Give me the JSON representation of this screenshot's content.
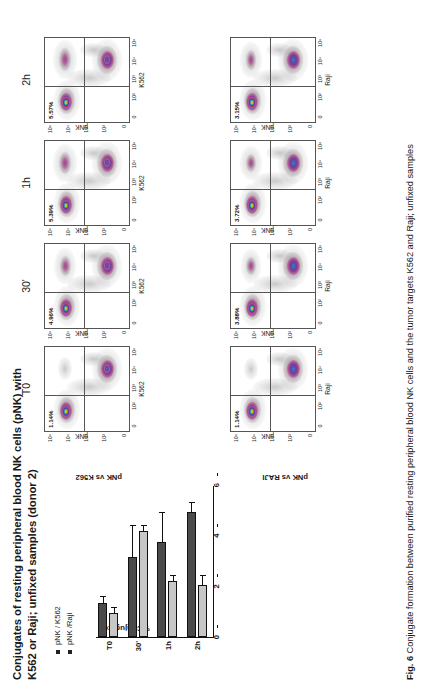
{
  "figure": {
    "title": "Conjugates of resting peripheral blood NK cells (pNK) with K562 or Raji; unfixed samples (donor 2)",
    "caption_label": "Fig. 6",
    "caption_text": "Conjugate formation between purified resting peripheral blood NK cells and the tumor targets K562 and Raji; unfixed samples"
  },
  "barchart": {
    "y_axis_title": "%Conjugates",
    "y_ticks": [
      "0",
      "2",
      "4",
      "6"
    ],
    "x_ticks": [
      "T0",
      "30'",
      "1h",
      "2h"
    ],
    "legend": [
      {
        "label": "pNK / K562",
        "color": "#4a4a4a"
      },
      {
        "label": "pNK /Raji",
        "color": "#c7c7c7"
      }
    ]
  },
  "chart_data": {
    "type": "bar",
    "title": "Conjugates of resting peripheral blood NK cells (pNK) with K562 or Raji; unfixed samples (donor 2)",
    "orientation": "vertical",
    "categories": [
      "T0",
      "30'",
      "1h",
      "2h"
    ],
    "xlabel": "",
    "ylabel": "%Conjugates",
    "ylim": [
      0,
      6
    ],
    "yticks": [
      0,
      2,
      4,
      6
    ],
    "grid": false,
    "legend_position": "top-left",
    "series": [
      {
        "name": "pNK / K562",
        "color": "#4a4a4a",
        "values": [
          1.35,
          3.15,
          3.75,
          4.95
        ],
        "errors": [
          0.22,
          1.25,
          1.15,
          0.35
        ]
      },
      {
        "name": "pNK /Raji",
        "color": "#c7c7c7",
        "values": [
          0.95,
          4.2,
          2.2,
          2.05
        ],
        "errors": [
          0.18,
          0.2,
          0.2,
          0.35
        ]
      }
    ]
  },
  "panels": {
    "columns": [
      "T0",
      "30'",
      "1h",
      "2h"
    ],
    "rows": [
      {
        "row_label": "pNK vs K562",
        "x_axis": "K562",
        "y_axis": "pNK",
        "percentages": [
          "1.14%",
          "4.96%",
          "5.39%",
          "5.57%"
        ]
      },
      {
        "row_label": "pNK vs RAJI",
        "x_axis": "Raji",
        "y_axis": "pNK",
        "percentages": [
          "1.14%",
          "3.88%",
          "3.72%",
          "3.15%"
        ]
      }
    ],
    "axis_ticks": [
      "0",
      "10²",
      "10³",
      "10⁴",
      "10⁵"
    ]
  }
}
